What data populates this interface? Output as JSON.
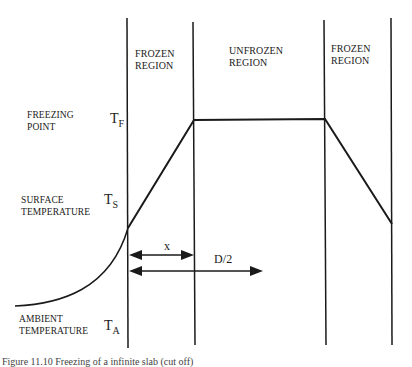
{
  "regions": [
    {
      "label_line1": "FROZEN",
      "label_line2": "REGION"
    },
    {
      "label_line1": "UNFROZEN",
      "label_line2": "REGION"
    },
    {
      "label_line1": "FROZEN",
      "label_line2": "REGION"
    }
  ],
  "left_labels": {
    "freezing_point": {
      "line1": "FREEZING",
      "line2": "POINT",
      "symbol": "T",
      "subscript": "F"
    },
    "surface_temperature": {
      "line1": "SURFACE",
      "line2": "TEMPERATURE",
      "symbol": "T",
      "subscript": "S"
    },
    "ambient_temperature": {
      "line1": "AMBIENT",
      "line2": "TEMPERATURE",
      "symbol": "T",
      "subscript": "A"
    }
  },
  "dimensions": {
    "x_label": "x",
    "half_diameter_label": "D/2"
  },
  "caption": "Figure 11.10  Freezing of a infinite slab (cut off)",
  "colors": {
    "line": "#1a1a1a",
    "background": "#ffffff"
  }
}
